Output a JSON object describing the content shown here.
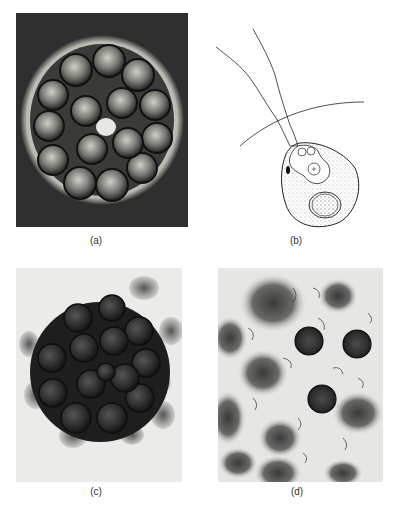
{
  "figure": {
    "panels": [
      {
        "id": "a",
        "label": "(a)",
        "type": "micrograph-dark-field"
      },
      {
        "id": "b",
        "label": "(b)",
        "type": "line-drawing"
      },
      {
        "id": "c",
        "label": "(c)",
        "type": "micrograph-bright-field"
      },
      {
        "id": "d",
        "label": "(d)",
        "type": "micrograph-bright-field"
      }
    ]
  },
  "colors": {
    "background": "#ffffff",
    "dark_field": "#2e2e2e",
    "light_field": "#ececec",
    "ink": "#1a1a1a"
  }
}
